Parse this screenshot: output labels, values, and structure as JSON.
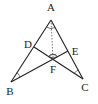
{
  "diagram": {
    "type": "geometry-triangle",
    "points": {
      "A": {
        "label": "A",
        "x": 51,
        "y": 20,
        "lx": 51,
        "ly": 11
      },
      "B": {
        "label": "B",
        "x": 11,
        "y": 82,
        "lx": 10,
        "ly": 95
      },
      "C": {
        "label": "C",
        "x": 83,
        "y": 79,
        "lx": 85,
        "ly": 91
      },
      "D": {
        "label": "D",
        "x": 34,
        "y": 47,
        "lx": 28,
        "ly": 48
      },
      "E": {
        "label": "E",
        "x": 68,
        "y": 51,
        "lx": 75,
        "ly": 55
      },
      "F": {
        "label": "F",
        "x": 53,
        "y": 58,
        "lx": 53,
        "ly": 73
      }
    },
    "segments": [
      {
        "from": "A",
        "to": "B",
        "style": "solid"
      },
      {
        "from": "A",
        "to": "C",
        "style": "solid"
      },
      {
        "from": "B",
        "to": "E",
        "style": "solid"
      },
      {
        "from": "C",
        "to": "D",
        "style": "solid"
      },
      {
        "from": "A",
        "to": "F",
        "style": "dashed"
      }
    ],
    "angle_marks": [
      "A",
      "B",
      "C",
      "F"
    ],
    "colors": {
      "stroke": "#222222",
      "background": "#ffffff"
    }
  }
}
